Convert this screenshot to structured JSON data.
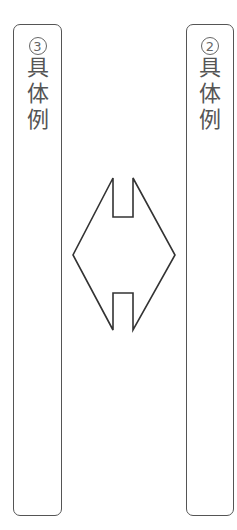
{
  "boxes": [
    {
      "id": "left",
      "number": "3",
      "text": [
        "具",
        "体",
        "例"
      ]
    },
    {
      "id": "right",
      "number": "2",
      "text": [
        "具",
        "体",
        "例"
      ]
    }
  ],
  "connector": {
    "type": "double-headed-arrow",
    "direction": "horizontal",
    "stroke": "#333333"
  },
  "colors": {
    "border": "#555555",
    "background": "#ffffff"
  }
}
